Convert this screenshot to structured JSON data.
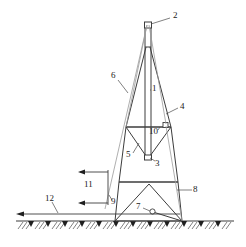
{
  "figure": {
    "kind": "patent-line-drawing",
    "stroke_color": "#3c3c3c",
    "thin_stroke_color": "#8a8a8a",
    "background": "#ffffff",
    "width": 246,
    "height": 247
  },
  "labels": [
    {
      "id": "2",
      "text": "2",
      "x": 173,
      "y": 16,
      "target": "mast-top-cap"
    },
    {
      "id": "6",
      "text": "6",
      "x": 111,
      "y": 76,
      "target": "guy-line-upper"
    },
    {
      "id": "1",
      "text": "1",
      "x": 152,
      "y": 88,
      "target": "central-mast"
    },
    {
      "id": "4",
      "text": "4",
      "x": 180,
      "y": 107,
      "target": "right-leg"
    },
    {
      "id": "10",
      "text": "10",
      "x": 152,
      "y": 131,
      "target": "upper-beam-node"
    },
    {
      "id": "5",
      "text": "5",
      "x": 127,
      "y": 155,
      "target": "v-truss-left-diagonal"
    },
    {
      "id": "3",
      "text": "3",
      "x": 156,
      "y": 163,
      "target": "v-truss-bottom-node"
    },
    {
      "id": "8",
      "text": "8",
      "x": 194,
      "y": 189,
      "target": "lower-right-leg"
    },
    {
      "id": "11",
      "text": "11",
      "x": 86,
      "y": 184,
      "target": "load-arrows-annotation"
    },
    {
      "id": "9",
      "text": "9",
      "x": 112,
      "y": 202,
      "target": "guy-line-lower"
    },
    {
      "id": "7",
      "text": "7",
      "x": 138,
      "y": 207,
      "target": "base-pivot-circle"
    },
    {
      "id": "12",
      "text": "12",
      "x": 47,
      "y": 199,
      "target": "ground-tie-line"
    }
  ]
}
